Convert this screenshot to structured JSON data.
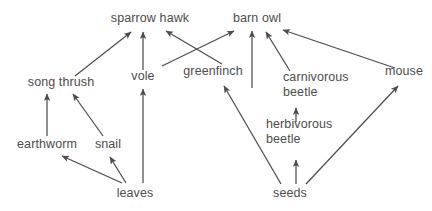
{
  "diagram": {
    "type": "food-web",
    "background_color": "#ffffff",
    "line_color": "#4d4d4d",
    "text_color": "#4d4d4d",
    "nodes": [
      {
        "id": "sparrow_hawk",
        "label": "sparrow hawk",
        "x": 150,
        "y": 22,
        "align": "center"
      },
      {
        "id": "barn_owl",
        "label": "barn owl",
        "x": 257,
        "y": 22,
        "align": "center"
      },
      {
        "id": "song_thrush",
        "label": "song thrush",
        "x": 61,
        "y": 86,
        "align": "center"
      },
      {
        "id": "vole",
        "label": "vole",
        "x": 143,
        "y": 80,
        "align": "center"
      },
      {
        "id": "greenfinch",
        "label": "greenfinch",
        "x": 213,
        "y": 75,
        "align": "center"
      },
      {
        "id": "carnivorous_beetle",
        "label": "carnivorous\nbeetle",
        "x": 283,
        "y": 81,
        "align": "left"
      },
      {
        "id": "mouse",
        "label": "mouse",
        "x": 404,
        "y": 75,
        "align": "center"
      },
      {
        "id": "herbivorous_beetle",
        "label": "herbivorous\nbeetle",
        "x": 266,
        "y": 128,
        "align": "left"
      },
      {
        "id": "earthworm",
        "label": "earthworm",
        "x": 47,
        "y": 148,
        "align": "center"
      },
      {
        "id": "snail",
        "label": "snail",
        "x": 108,
        "y": 148,
        "align": "center"
      },
      {
        "id": "leaves",
        "label": "leaves",
        "x": 135,
        "y": 197,
        "align": "center"
      },
      {
        "id": "seeds",
        "label": "seeds",
        "x": 290,
        "y": 197,
        "align": "center"
      }
    ],
    "links": [
      {
        "id": "leaves-earthworm",
        "from": "leaves",
        "to": "earthworm",
        "x1": 122,
        "y1": 183,
        "x2": 62,
        "y2": 156
      },
      {
        "id": "leaves-snail",
        "from": "leaves",
        "to": "snail",
        "x1": 126,
        "y1": 183,
        "x2": 110,
        "y2": 157
      },
      {
        "id": "leaves-vole",
        "from": "leaves",
        "to": "vole",
        "x1": 143,
        "y1": 183,
        "x2": 143,
        "y2": 89
      },
      {
        "id": "earthworm-song-thrush",
        "from": "earthworm",
        "to": "song thrush",
        "x1": 47,
        "y1": 136,
        "x2": 47,
        "y2": 94
      },
      {
        "id": "snail-song-thrush",
        "from": "snail",
        "to": "song thrush",
        "x1": 103,
        "y1": 136,
        "x2": 73,
        "y2": 94
      },
      {
        "id": "song-thrush-sparrow-hawk",
        "from": "song thrush",
        "to": "sparrow hawk",
        "x1": 75,
        "y1": 76,
        "x2": 131,
        "y2": 32
      },
      {
        "id": "vole-sparrow-hawk",
        "from": "vole",
        "to": "sparrow hawk",
        "x1": 143,
        "y1": 70,
        "x2": 143,
        "y2": 32
      },
      {
        "id": "greenfinch-sparrow-hawk",
        "from": "greenfinch",
        "to": "sparrow hawk",
        "x1": 222,
        "y1": 64,
        "x2": 166,
        "y2": 31
      },
      {
        "id": "vole-barn-owl",
        "from": "vole",
        "to": "barn owl",
        "x1": 162,
        "y1": 66,
        "x2": 234,
        "y2": 31
      },
      {
        "id": "seeds-greenfinch",
        "from": "seeds",
        "to": "greenfinch",
        "x1": 281,
        "y1": 184,
        "x2": 224,
        "y2": 86
      },
      {
        "id": "greenfinch-barn-owl",
        "from": "greenfinch",
        "to": "barn owl",
        "x1": 252,
        "y1": 88,
        "x2": 252,
        "y2": 31
      },
      {
        "id": "seeds-herbivorous-beetle",
        "from": "seeds",
        "to": "herbivorous beetle",
        "x1": 296,
        "y1": 184,
        "x2": 296,
        "y2": 160
      },
      {
        "id": "herb-beetle-carn-beetle",
        "from": "herbivorous beetle",
        "to": "carnivorous beetle",
        "x1": 296,
        "y1": 122,
        "x2": 296,
        "y2": 108
      },
      {
        "id": "carn-beetle-barn-owl",
        "from": "carnivorous beetle",
        "to": "barn owl",
        "x1": 290,
        "y1": 71,
        "x2": 266,
        "y2": 32
      },
      {
        "id": "seeds-mouse",
        "from": "seeds",
        "to": "mouse",
        "x1": 306,
        "y1": 184,
        "x2": 398,
        "y2": 86
      },
      {
        "id": "mouse-barn-owl",
        "from": "mouse",
        "to": "barn owl",
        "x1": 395,
        "y1": 68,
        "x2": 283,
        "y2": 30
      }
    ]
  }
}
